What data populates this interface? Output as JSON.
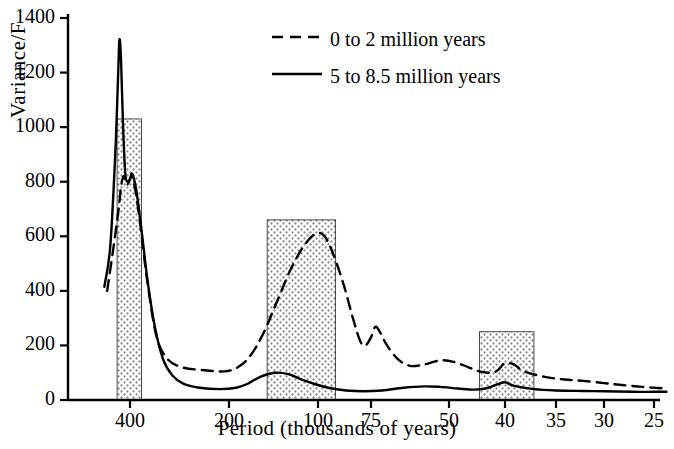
{
  "chart_data": {
    "type": "line",
    "title": "",
    "xlabel": "Period (thousands of years)",
    "ylabel": "Variance/F",
    "xlim_note": "x axis is period in thousands of years, decreasing left to right (non-linear / reciprocal spacing)",
    "xticks": [
      "400",
      "200",
      "100",
      "75",
      "50",
      "40",
      "35",
      "30",
      "25"
    ],
    "yticks": [
      "0",
      "200",
      "400",
      "600",
      "800",
      "1000",
      "1200",
      "1400"
    ],
    "ylim": [
      0,
      1400
    ],
    "grid": false,
    "legend_position": "top-center",
    "series": [
      {
        "name": "0 to 2 million years",
        "style": "dashed",
        "points": [
          [
            520,
            400
          ],
          [
            480,
            560
          ],
          [
            452,
            700
          ],
          [
            440,
            780
          ],
          [
            428,
            820
          ],
          [
            414,
            790
          ],
          [
            404,
            800
          ],
          [
            392,
            820
          ],
          [
            378,
            760
          ],
          [
            362,
            640
          ],
          [
            340,
            430
          ],
          [
            315,
            230
          ],
          [
            290,
            150
          ],
          [
            262,
            120
          ],
          [
            232,
            110
          ],
          [
            205,
            105
          ],
          [
            182,
            120
          ],
          [
            162,
            160
          ],
          [
            145,
            240
          ],
          [
            130,
            360
          ],
          [
            118,
            480
          ],
          [
            108,
            570
          ],
          [
            101,
            610
          ],
          [
            96,
            600
          ],
          [
            91,
            530
          ],
          [
            86,
            420
          ],
          [
            82,
            300
          ],
          [
            79,
            215
          ],
          [
            77,
            200
          ],
          [
            75,
            230
          ],
          [
            73,
            268
          ],
          [
            71,
            250
          ],
          [
            68,
            200
          ],
          [
            64,
            150
          ],
          [
            60,
            125
          ],
          [
            56,
            130
          ],
          [
            52,
            145
          ],
          [
            49,
            140
          ],
          [
            46,
            120
          ],
          [
            44,
            105
          ],
          [
            42,
            100
          ],
          [
            41,
            110
          ],
          [
            40,
            135
          ],
          [
            39,
            130
          ],
          [
            38,
            105
          ],
          [
            36,
            85
          ],
          [
            34,
            75
          ],
          [
            32,
            70
          ],
          [
            30,
            62
          ],
          [
            28,
            55
          ],
          [
            26,
            48
          ],
          [
            24,
            42
          ]
        ]
      },
      {
        "name": "5 to 8.5 million years",
        "style": "solid",
        "points": [
          [
            540,
            415
          ],
          [
            500,
            560
          ],
          [
            470,
            900
          ],
          [
            455,
            1180
          ],
          [
            448,
            1320
          ],
          [
            440,
            1250
          ],
          [
            430,
            1000
          ],
          [
            420,
            830
          ],
          [
            410,
            800
          ],
          [
            400,
            810
          ],
          [
            392,
            830
          ],
          [
            382,
            800
          ],
          [
            372,
            740
          ],
          [
            358,
            620
          ],
          [
            340,
            440
          ],
          [
            320,
            270
          ],
          [
            300,
            150
          ],
          [
            280,
            90
          ],
          [
            260,
            60
          ],
          [
            235,
            45
          ],
          [
            210,
            40
          ],
          [
            185,
            45
          ],
          [
            165,
            60
          ],
          [
            148,
            85
          ],
          [
            132,
            100
          ],
          [
            120,
            95
          ],
          [
            110,
            75
          ],
          [
            100,
            55
          ],
          [
            92,
            42
          ],
          [
            85,
            35
          ],
          [
            78,
            32
          ],
          [
            70,
            35
          ],
          [
            62,
            45
          ],
          [
            56,
            50
          ],
          [
            52,
            48
          ],
          [
            48,
            42
          ],
          [
            45,
            38
          ],
          [
            43,
            42
          ],
          [
            41,
            58
          ],
          [
            40,
            65
          ],
          [
            39,
            52
          ],
          [
            37,
            40
          ],
          [
            35,
            35
          ],
          [
            32,
            33
          ],
          [
            30,
            32
          ],
          [
            27,
            30
          ],
          [
            25,
            30
          ],
          [
            24,
            30
          ]
        ]
      }
    ],
    "shaded_bands": [
      {
        "label": "band-400k",
        "x_from": 460,
        "x_to": 358,
        "y_top": 1030
      },
      {
        "label": "band-100k",
        "x_from": 140,
        "x_to": 90,
        "y_top": 660
      },
      {
        "label": "band-41k",
        "x_from": 44,
        "x_to": 37,
        "y_top": 250
      }
    ]
  },
  "legend": {
    "items": [
      {
        "label": "0 to 2 million years",
        "style": "dashed"
      },
      {
        "label": "5 to 8.5 million years",
        "style": "solid"
      }
    ]
  }
}
